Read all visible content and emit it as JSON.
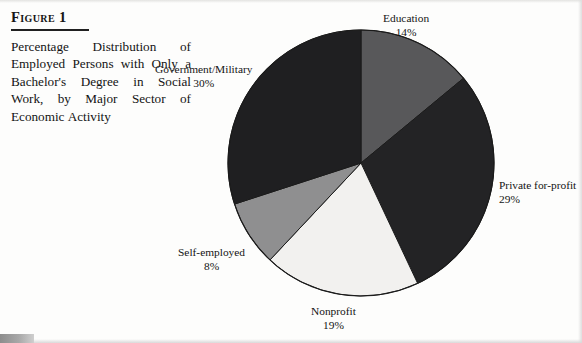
{
  "figure": {
    "title": "Figure 1",
    "caption": "Percentage Distribution of Employed Persons with Only a Bachelor's Degree in Social Work, by Major Sector of Economic Activity"
  },
  "chart_data": {
    "type": "pie",
    "title": "Percentage Distribution of Employed Persons with Only a Bachelor's Degree in Social Work, by Major Sector of Economic Activity",
    "xlabel": "",
    "ylabel": "",
    "unit": "percent",
    "start_angle_deg": 0,
    "direction": "clockwise",
    "legend": "none (direct slice labels)",
    "grid": false,
    "categories": [
      "Education",
      "Private for-profit",
      "Nonprofit",
      "Self-employed",
      "Government/Military"
    ],
    "values": [
      14,
      29,
      19,
      8,
      30
    ],
    "value_labels": [
      "14%",
      "29%",
      "19%",
      "8%",
      "30%"
    ],
    "slices": [
      {
        "label": "Education",
        "value": 14,
        "value_label": "14%",
        "color": "#58585a"
      },
      {
        "label": "Private for-profit",
        "value": 29,
        "value_label": "29%",
        "color": "#232325"
      },
      {
        "label": "Nonprofit",
        "value": 19,
        "value_label": "19%",
        "color": "#f2f1ef"
      },
      {
        "label": "Self-employed",
        "value": 8,
        "value_label": "8%",
        "color": "#8f8f90"
      },
      {
        "label": "Government/Military",
        "value": 30,
        "value_label": "30%",
        "color": "#1f1f21"
      }
    ],
    "total": 100,
    "stroke_color": "#1b1b1b",
    "geometry": {
      "center_x": 361,
      "center_y": 163,
      "radius": 133
    }
  },
  "colors": {
    "page_background": "#fdfdfc",
    "text": "#141414",
    "rule": "#202020"
  }
}
